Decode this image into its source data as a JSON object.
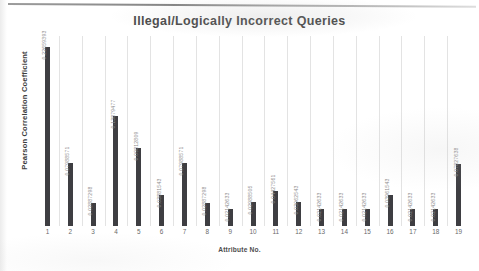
{
  "chart_data": {
    "type": "bar",
    "title": "Illegal/Logically Incorrect Queries",
    "xlabel": "Attribute No.",
    "ylabel": "Pearson Correlation Coefficient",
    "grid": "vertical-category-separators",
    "legend": "none",
    "ylim": [
      0,
      0.24
    ],
    "categories": [
      "1",
      "2",
      "3",
      "4",
      "5",
      "6",
      "7",
      "8",
      "9",
      "10",
      "11",
      "12",
      "13",
      "14",
      "15",
      "16",
      "17",
      "18",
      "19"
    ],
    "values": [
      0.22659393,
      0.07988571,
      0.02887298,
      0.13879477,
      0.09812809,
      0.03881543,
      0.07988571,
      0.02887298,
      0.02142633,
      0.02988505,
      0.04427561,
      0.03062543,
      0.02142633,
      0.02142633,
      0.02142633,
      0.03961543,
      0.02142633,
      0.02142633,
      0.07827638
    ],
    "value_labels": [
      "0.22659393",
      "0.07988571",
      "0.02887298",
      "0.13879477",
      "0.09812809",
      "0.03881543",
      "0.07988571",
      "0.02887298",
      "0.02142633",
      "0.02988505",
      "0.04427561",
      "0.03062543",
      "0.02142633",
      "0.02142633",
      "0.02142633",
      "0.03961543",
      "0.02142633",
      "0.02142633",
      "0.07827638"
    ],
    "bar_color": "#3e3e42",
    "gridline_color": "#e3e3e3",
    "label_color": "#8d8d8d"
  }
}
